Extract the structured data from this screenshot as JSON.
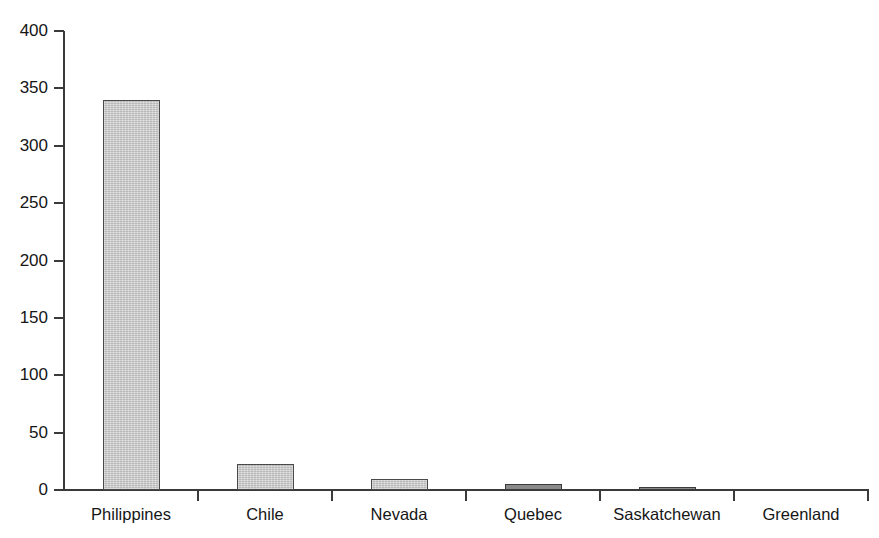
{
  "chart_data": {
    "type": "bar",
    "title": "",
    "subtitle": "",
    "xlabel": "",
    "ylabel": "",
    "categories": [
      "Philippines",
      "Chile",
      "Nevada",
      "Quebec",
      "Saskatchewan",
      "Greenland"
    ],
    "values": [
      340,
      23,
      10,
      5,
      1.5,
      0
    ],
    "series": [
      {
        "name": "",
        "values": [
          340,
          23,
          10,
          5,
          1.5,
          0
        ]
      }
    ],
    "ylim": [
      0,
      400
    ],
    "yticks": [
      0,
      50,
      100,
      150,
      200,
      250,
      300,
      350,
      400
    ],
    "ytick_labels": [
      "0",
      "50",
      "100",
      "150",
      "200",
      "250",
      "300",
      "350",
      "400"
    ],
    "grid": false,
    "legend": false,
    "legend_position": "none",
    "bar_color": "#c9c9c9",
    "bar_edge_color": "#4a4a4a",
    "axis_color": "#3a3a3a",
    "background_color": "#ffffff",
    "annotations": []
  }
}
